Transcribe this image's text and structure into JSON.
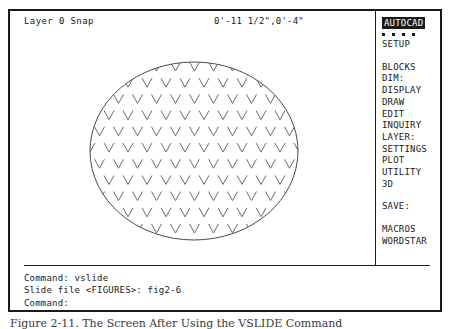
{
  "status_bar": {
    "layer_status": "Layer 0 Snap",
    "coordinates": "0'-11 1/2\",0'-4\""
  },
  "side_menu": {
    "title": "AUTOCAD",
    "dots_count": 4,
    "items": [
      {
        "label": "SETUP",
        "gap_before": false
      },
      {
        "label": "BLOCKS",
        "gap_before": true
      },
      {
        "label": "DIM:",
        "gap_before": false
      },
      {
        "label": "DISPLAY",
        "gap_before": false
      },
      {
        "label": "DRAW",
        "gap_before": false
      },
      {
        "label": "EDIT",
        "gap_before": false
      },
      {
        "label": "INQUIRY",
        "gap_before": false
      },
      {
        "label": "LAYER:",
        "gap_before": false
      },
      {
        "label": "SETTINGS",
        "gap_before": false
      },
      {
        "label": "PLOT",
        "gap_before": false
      },
      {
        "label": "UTILITY",
        "gap_before": false
      },
      {
        "label": "3D",
        "gap_before": false
      },
      {
        "label": "SAVE:",
        "gap_before": true
      },
      {
        "label": "MACROS",
        "gap_before": true
      },
      {
        "label": "WORDSTAR",
        "gap_before": false
      }
    ]
  },
  "command_area": {
    "lines": [
      "Command: vslide",
      "Slide file <FIGURES>: fig2-6",
      "Command:"
    ]
  },
  "drawing": {
    "shape": "ellipse",
    "hatch_pattern": "chevron-v-marks",
    "ellipse": {
      "center_x": 184,
      "center_y": 114,
      "radius_x": 104,
      "radius_y": 89
    },
    "hatch": {
      "spacing_x": 19,
      "spacing_y": 16.2,
      "mark_width": 10,
      "mark_height": 9,
      "row_offset_x": 9.5
    },
    "line_color": "#4a4a4a",
    "hatch_color": "#6a6a6a"
  },
  "caption": {
    "text": "Figure 2-11.   The Screen After Using the VSLIDE Command"
  },
  "colors": {
    "foreground": "#1a1a1a",
    "background": "#ffffff",
    "highlight_bg": "#1a1a1a",
    "highlight_fg": "#ffffff"
  }
}
